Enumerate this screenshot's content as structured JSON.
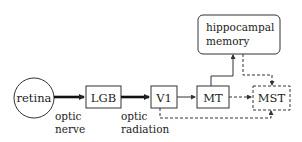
{
  "diagram": {
    "nodes": {
      "retina": {
        "label": "retina",
        "shape": "circle"
      },
      "lgb": {
        "label": "LGB",
        "shape": "box"
      },
      "v1": {
        "label": "V1",
        "shape": "box"
      },
      "mt": {
        "label": "MT",
        "shape": "box"
      },
      "mst": {
        "label": "MST",
        "shape": "dashed-box"
      },
      "hippocampal": {
        "line1": "hippocampal",
        "line2": "memory",
        "shape": "rounded-box"
      }
    },
    "edge_labels": {
      "optic_nerve": {
        "line1": "optic",
        "line2": "nerve"
      },
      "optic_radiation": {
        "line1": "optic",
        "line2": "radiation"
      }
    },
    "edges": [
      {
        "from": "retina",
        "to": "lgb",
        "style": "thick-arrow"
      },
      {
        "from": "lgb",
        "to": "v1",
        "style": "thick-arrow"
      },
      {
        "from": "v1",
        "to": "mt",
        "style": "solid-arrow"
      },
      {
        "from": "mt",
        "to": "hippocampal",
        "style": "solid-arrow"
      },
      {
        "from": "hippocampal",
        "to": "mst",
        "style": "dashed-arrow"
      },
      {
        "from": "mt",
        "to": "mst",
        "style": "dashed-arrow"
      },
      {
        "from": "v1",
        "to": "mst",
        "style": "dashed-arrow"
      }
    ],
    "colors": {
      "stroke": "#333333",
      "text": "#222222",
      "background": "#ffffff"
    }
  }
}
